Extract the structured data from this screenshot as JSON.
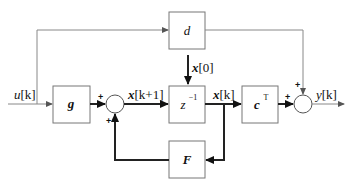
{
  "diagram": {
    "type": "block-diagram",
    "blocks": {
      "g": "g",
      "d": "d",
      "delay_base": "z",
      "delay_exp": "−1",
      "c_base": "c",
      "c_exp": "T",
      "F": "F"
    },
    "signals": {
      "input": "u[k]",
      "next_state": "x[k+1]",
      "initial_state": "x[0]",
      "state": "x[k]",
      "output": "y[k]"
    },
    "signal_parts": {
      "input_var": "u",
      "input_idx": "[k]",
      "next_state_var": "x",
      "next_state_idx": "[k+1]",
      "initial_state_var": "x",
      "initial_state_idx": "[0]",
      "state_var": "x",
      "state_idx": "[k]",
      "output_var": "y",
      "output_idx": "[k]"
    },
    "summers": {
      "sum1_in_left": "+",
      "sum1_in_bottom": "+",
      "sum2_in_left": "+",
      "sum2_in_top": "+"
    },
    "connections": [
      {
        "from": "u[k]",
        "to": "g"
      },
      {
        "from": "u[k]",
        "to": "d"
      },
      {
        "from": "g",
        "to": "sum1"
      },
      {
        "from": "sum1",
        "to": "z^-1"
      },
      {
        "from": "x[0]",
        "to": "z^-1"
      },
      {
        "from": "z^-1",
        "to": "c^T"
      },
      {
        "from": "z^-1",
        "to": "F"
      },
      {
        "from": "F",
        "to": "sum1"
      },
      {
        "from": "c^T",
        "to": "sum2"
      },
      {
        "from": "d",
        "to": "sum2"
      },
      {
        "from": "sum2",
        "to": "y[k]"
      }
    ]
  }
}
